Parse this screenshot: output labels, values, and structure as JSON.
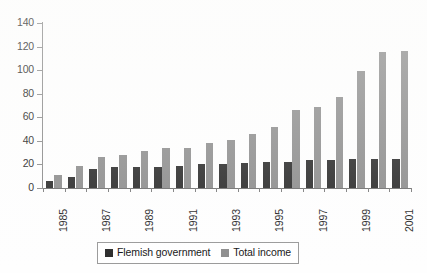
{
  "chart_data": {
    "type": "bar",
    "title": "",
    "subtitle": "",
    "xlabel": "",
    "ylabel": "",
    "ylim": [
      0,
      140
    ],
    "yticks": [
      0,
      20,
      40,
      60,
      80,
      100,
      120,
      140
    ],
    "grid": false,
    "legend_position": "bottom",
    "categories": [
      "1985",
      "1986",
      "1987",
      "1988",
      "1989",
      "1990",
      "1991",
      "1992",
      "1993",
      "1994",
      "1995",
      "1996",
      "1997",
      "1998",
      "1999",
      "2000",
      "2001"
    ],
    "visible_xtick_labels": [
      "1985",
      "1987",
      "1989",
      "1991",
      "1993",
      "1995",
      "1997",
      "1999",
      "2001"
    ],
    "series": [
      {
        "name": "Flemish government",
        "color": "#2a2a2a",
        "values": [
          6,
          9,
          16,
          18,
          18,
          18,
          19,
          20,
          20,
          21,
          22,
          22,
          24,
          24,
          25,
          25,
          25
        ]
      },
      {
        "name": "Total income",
        "color": "#8d8d8d",
        "values": [
          11,
          19,
          26,
          28,
          31,
          34,
          34,
          38,
          41,
          46,
          52,
          66,
          69,
          77,
          99,
          115,
          116
        ]
      }
    ]
  },
  "legend": {
    "items": [
      {
        "label": "Flemish government",
        "swatch": "dark"
      },
      {
        "label": "Total income",
        "swatch": "gray"
      }
    ]
  },
  "axis": {
    "y_labels": [
      "140",
      "120",
      "100",
      "80",
      "60",
      "40",
      "20",
      "0"
    ]
  }
}
